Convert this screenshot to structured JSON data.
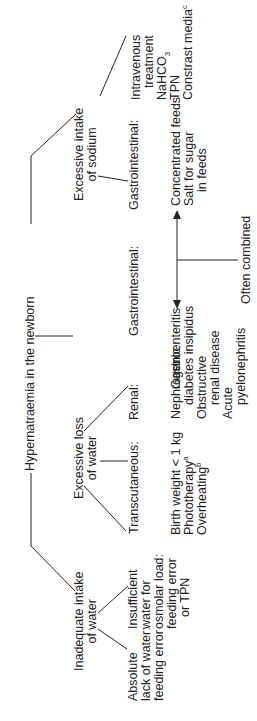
{
  "title": "Hypernatraemia in the newborn",
  "branches": {
    "inadequate": {
      "label_l1": "Inadequate intake",
      "label_l2": "of water",
      "children": [
        {
          "l1": "Absolute",
          "l2": "lack of water:",
          "l3": "feeding error"
        },
        {
          "l1": "Insufficient",
          "l2": "water for",
          "l3": "osmolar load:",
          "l4": "feeding error",
          "l5": "or TPN"
        }
      ]
    },
    "loss": {
      "label_l1": "Excessive loss",
      "label_l2": "of water",
      "transcutaneous": {
        "label": "Transcutaneous:",
        "items": [
          "Birth weight < 1 kg",
          "Phototherapy",
          "Overheating"
        ],
        "sup": [
          "a",
          "b"
        ]
      },
      "renal": {
        "label": "Renal:",
        "items": [
          "Nephrogenic",
          "diabetes insipidus",
          "Obstructive",
          "renal disease",
          "Acute",
          "pyelonephritis"
        ]
      },
      "gastro": {
        "label": "Gastrointestinal:",
        "item": "Gastroenteritis"
      }
    },
    "sodium": {
      "label_l1": "Excessive intake",
      "label_l2": "of sodium",
      "gastro": {
        "label": "Gastrointestinal:",
        "items": [
          "Concentrated feeds",
          "Salt for sugar",
          "in feeds"
        ]
      },
      "intravenous": {
        "label_l1": "Intravenous",
        "label_l2": "treatment",
        "items": [
          "NaHCO",
          "TPN",
          "Constrast media"
        ],
        "sub": "3",
        "sup": "c"
      }
    }
  },
  "combined_note": "Often combined"
}
